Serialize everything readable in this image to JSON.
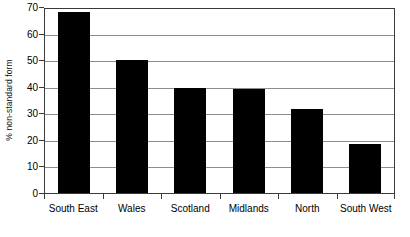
{
  "chart_data": {
    "type": "bar",
    "title": "",
    "subtitle": "",
    "xlabel": "",
    "ylabel": "% non-standard form",
    "categories": [
      "South East",
      "Wales",
      "Scotland",
      "Midlands",
      "North",
      "South West"
    ],
    "values": [
      68,
      50,
      39.5,
      39,
      31.5,
      18.3
    ],
    "series": [
      {
        "name": "% non-standard form",
        "values": [
          68,
          50,
          39.5,
          39,
          31.5,
          18.3
        ]
      }
    ],
    "ylim": [
      0,
      70
    ],
    "ytick_labels": [
      "0",
      "10",
      "20",
      "30",
      "40",
      "50",
      "60",
      "70"
    ],
    "ytick_values": [
      0,
      10,
      20,
      30,
      40,
      50,
      60,
      70
    ],
    "grid": true,
    "grid_axis": "y",
    "legend": false,
    "legend_position": "none",
    "bar_color": "#000000",
    "grid_color": "#8d8d8d",
    "axis_color": "#3a3a3a",
    "background_color": "#ffffff",
    "annotations": []
  }
}
